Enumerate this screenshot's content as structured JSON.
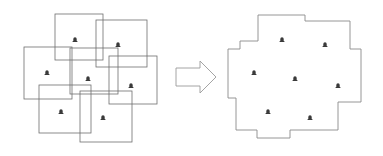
{
  "figure": {
    "title": "",
    "background_color": "#ffffff",
    "width": 383,
    "height": 156
  },
  "colors": {
    "rectangle_stroke": "#6e6e6e",
    "merged_stroke": "#8a8a8a",
    "arrow_stroke": "#9a9a9a",
    "marker_fill": "#3a3a3a",
    "fill": "#ffffff"
  },
  "left_panel": {
    "name": "overlapping-rectangles-panel",
    "description": "Seven overlapping axis-aligned rectangles, each containing one marker",
    "rectangles": [
      {
        "id": "rect-1",
        "x": 55,
        "y": 14,
        "width": 48,
        "height": 46
      },
      {
        "id": "rect-2",
        "x": 96,
        "y": 20,
        "width": 51,
        "height": 47
      },
      {
        "id": "rect-3",
        "x": 24,
        "y": 47,
        "width": 48,
        "height": 52
      },
      {
        "id": "rect-4",
        "x": 70,
        "y": 48,
        "width": 48,
        "height": 46
      },
      {
        "id": "rect-5",
        "x": 109,
        "y": 56,
        "width": 48,
        "height": 48
      },
      {
        "id": "rect-6",
        "x": 39,
        "y": 85,
        "width": 52,
        "height": 48
      },
      {
        "id": "rect-7",
        "x": 80,
        "y": 91,
        "width": 52,
        "height": 51
      }
    ],
    "markers": [
      {
        "id": "marker-l1",
        "x": 75,
        "y": 40,
        "icon": "map-pin-icon"
      },
      {
        "id": "marker-l2",
        "x": 118,
        "y": 45,
        "icon": "map-pin-icon"
      },
      {
        "id": "marker-l3",
        "x": 47,
        "y": 73,
        "icon": "map-pin-icon"
      },
      {
        "id": "marker-l4",
        "x": 88,
        "y": 79,
        "icon": "map-pin-icon"
      },
      {
        "id": "marker-l5",
        "x": 131,
        "y": 86,
        "icon": "map-pin-icon"
      },
      {
        "id": "marker-l6",
        "x": 61,
        "y": 112,
        "icon": "map-pin-icon"
      },
      {
        "id": "marker-l7",
        "x": 103,
        "y": 118,
        "icon": "map-pin-icon"
      }
    ]
  },
  "arrow": {
    "name": "transform-arrow",
    "icon": "right-arrow-icon",
    "direction": "right",
    "points": "176,68 200,68 200,61 216,77 200,93 200,86 176,86"
  },
  "right_panel": {
    "name": "merged-polygon-panel",
    "description": "Union of the overlapping rectangles forming a single dissolved boundary polygon",
    "polygon_points": "258,15 305,15 305,21 350,21 350,49 361,49 361,102 338,102 338,130 290,130 290,138 257,138 257,130 236,130 236,98 228,98 228,49 240,49 240,41 258,41",
    "markers": [
      {
        "id": "marker-r1",
        "x": 282,
        "y": 40,
        "icon": "map-pin-icon"
      },
      {
        "id": "marker-r2",
        "x": 325,
        "y": 45,
        "icon": "map-pin-icon"
      },
      {
        "id": "marker-r3",
        "x": 254,
        "y": 73,
        "icon": "map-pin-icon"
      },
      {
        "id": "marker-r4",
        "x": 295,
        "y": 79,
        "icon": "map-pin-icon"
      },
      {
        "id": "marker-r5",
        "x": 338,
        "y": 86,
        "icon": "map-pin-icon"
      },
      {
        "id": "marker-r6",
        "x": 268,
        "y": 112,
        "icon": "map-pin-icon"
      },
      {
        "id": "marker-r7",
        "x": 310,
        "y": 118,
        "icon": "map-pin-icon"
      }
    ]
  }
}
